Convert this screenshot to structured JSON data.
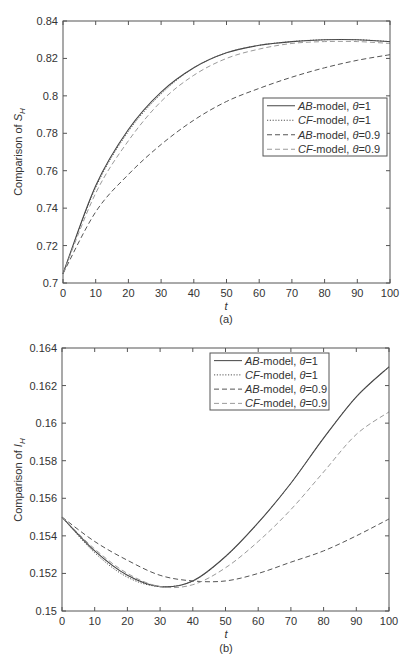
{
  "chart_data": [
    {
      "type": "line",
      "panel": "(a)",
      "title": "",
      "xlabel": "t",
      "ylabel": "Comparison of S_H",
      "ylabel_main": "Comparison of ",
      "ylabel_sym": "S",
      "ylabel_sub": "H",
      "xlim": [
        0,
        100
      ],
      "ylim": [
        0.7,
        0.84
      ],
      "xticks": [
        "0",
        "10",
        "20",
        "30",
        "40",
        "50",
        "60",
        "70",
        "80",
        "90",
        "100"
      ],
      "yticks": [
        "0.7",
        "0.72",
        "0.74",
        "0.76",
        "0.78",
        "0.8",
        "0.82",
        "0.84"
      ],
      "grid": false,
      "legend_position": "center-right",
      "x": [
        0,
        10,
        20,
        30,
        40,
        50,
        60,
        70,
        80,
        90,
        100
      ],
      "series": [
        {
          "name": "AB-model, θ=1",
          "model": "AB",
          "theta": "1",
          "style": "solid",
          "color": "#444444",
          "values": [
            0.705,
            0.752,
            0.782,
            0.802,
            0.815,
            0.823,
            0.827,
            0.829,
            0.83,
            0.83,
            0.829
          ]
        },
        {
          "name": "CF-model, θ=1",
          "model": "CF",
          "theta": "1",
          "style": "dotted",
          "color": "#555555",
          "values": [
            0.705,
            0.751,
            0.781,
            0.801,
            0.815,
            0.823,
            0.827,
            0.829,
            0.83,
            0.83,
            0.829
          ]
        },
        {
          "name": "AB-model, θ=0.9",
          "model": "AB",
          "theta": "0.9",
          "style": "dashed",
          "color": "#555555",
          "values": [
            0.705,
            0.738,
            0.758,
            0.774,
            0.787,
            0.797,
            0.804,
            0.81,
            0.815,
            0.819,
            0.822
          ]
        },
        {
          "name": "CF-model, θ=0.9",
          "model": "CF",
          "theta": "0.9",
          "style": "dashed",
          "color": "#9a9a9a",
          "values": [
            0.705,
            0.748,
            0.776,
            0.797,
            0.811,
            0.82,
            0.825,
            0.828,
            0.829,
            0.829,
            0.828
          ]
        }
      ]
    },
    {
      "type": "line",
      "panel": "(b)",
      "title": "",
      "xlabel": "t",
      "ylabel": "Comparison of I_H",
      "ylabel_main": "Comparison of ",
      "ylabel_sym": "I",
      "ylabel_sub": "H",
      "xlim": [
        0,
        100
      ],
      "ylim": [
        0.15,
        0.164
      ],
      "xticks": [
        "0",
        "10",
        "20",
        "30",
        "40",
        "50",
        "60",
        "70",
        "80",
        "90",
        "100"
      ],
      "yticks": [
        "0.15",
        "0.152",
        "0.154",
        "0.156",
        "0.158",
        "0.16",
        "0.162",
        "0.164"
      ],
      "grid": false,
      "legend_position": "upper-right",
      "x": [
        0,
        10,
        20,
        30,
        40,
        50,
        60,
        70,
        80,
        90,
        100
      ],
      "series": [
        {
          "name": "AB-model, θ=1",
          "model": "AB",
          "theta": "1",
          "style": "solid",
          "color": "#444444",
          "values": [
            0.155,
            0.1532,
            0.1519,
            0.1513,
            0.1516,
            0.1529,
            0.1547,
            0.1568,
            0.1592,
            0.1614,
            0.163
          ]
        },
        {
          "name": "CF-model, θ=1",
          "model": "CF",
          "theta": "1",
          "style": "dotted",
          "color": "#555555",
          "values": [
            0.155,
            0.1531,
            0.1518,
            0.1513,
            0.1516,
            0.1529,
            0.1547,
            0.1568,
            0.1592,
            0.1614,
            0.163
          ]
        },
        {
          "name": "AB-model, θ=0.9",
          "model": "AB",
          "theta": "0.9",
          "style": "dashed",
          "color": "#555555",
          "values": [
            0.155,
            0.1537,
            0.1527,
            0.1519,
            0.1516,
            0.1516,
            0.152,
            0.1526,
            0.1532,
            0.154,
            0.1549
          ]
        },
        {
          "name": "CF-model, θ=0.9",
          "model": "CF",
          "theta": "0.9",
          "style": "dashed",
          "color": "#9a9a9a",
          "values": [
            0.155,
            0.1533,
            0.152,
            0.1513,
            0.1514,
            0.1523,
            0.1537,
            0.1554,
            0.1574,
            0.1594,
            0.1606
          ]
        }
      ]
    }
  ],
  "legend": {
    "entries": [
      {
        "model": "AB",
        "suffix": "-model, ",
        "theta_sym": "θ",
        "eq": "=",
        "theta": "1"
      },
      {
        "model": "CF",
        "suffix": "-model, ",
        "theta_sym": "θ",
        "eq": "=",
        "theta": "1"
      },
      {
        "model": "AB",
        "suffix": "-model, ",
        "theta_sym": "θ",
        "eq": "=",
        "theta": "0.9"
      },
      {
        "model": "CF",
        "suffix": "-model, ",
        "theta_sym": "θ",
        "eq": "=",
        "theta": "0.9"
      }
    ]
  },
  "captions": {
    "a": "(a)",
    "b": "(b)"
  },
  "xlabel_symbol": "t"
}
